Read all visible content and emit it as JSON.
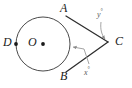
{
  "figure": {
    "type": "circle-with-two-tangents",
    "background_color": "#ffffff",
    "stroke_color": "#3a3a3a",
    "leader_color": "#8a8a8a",
    "label_color": "#1a1a1a",
    "circle": {
      "center_x": 43,
      "center_y": 44,
      "radius": 27
    },
    "points": [
      {
        "id": "A",
        "label": "A",
        "x": 66,
        "y": 16,
        "dot": false
      },
      {
        "id": "B",
        "label": "B",
        "x": 66,
        "y": 72,
        "dot": false
      },
      {
        "id": "C",
        "label": "C",
        "x": 108,
        "y": 42,
        "dot": false
      },
      {
        "id": "D",
        "label": "D",
        "x": 16,
        "y": 44,
        "dot": true
      },
      {
        "id": "O",
        "label": "O",
        "x": 43,
        "y": 44,
        "dot": true
      }
    ],
    "dots": [
      {
        "id": "dot-D",
        "x": 16,
        "y": 44
      },
      {
        "id": "dot-O",
        "x": 43,
        "y": 44
      }
    ],
    "segments": [
      {
        "id": "tangent-AC",
        "from": "A",
        "to": "C",
        "x1": 66,
        "y1": 16,
        "x2": 108,
        "y2": 42
      },
      {
        "id": "tangent-BC",
        "from": "B",
        "to": "C",
        "x1": 66,
        "y1": 72,
        "x2": 108,
        "y2": 42
      }
    ],
    "angle_labels": [
      {
        "id": "angle-y",
        "text": "y",
        "degree_symbol": "°",
        "x": 100,
        "y": 12
      },
      {
        "id": "angle-x",
        "text": "x",
        "degree_symbol": "°",
        "x": 88,
        "y": 70
      }
    ],
    "leaders": [
      {
        "id": "leader-y",
        "from_label": "angle-y",
        "path": "M 101,22 C 100,30 102,36 105,40",
        "arrow_at": {
          "x": 105,
          "y": 40
        }
      },
      {
        "id": "leader-x",
        "from_label": "angle-x",
        "path": "M 89,65 L 84,50 L 73,47",
        "arrow_at": {
          "x": 69,
          "y": 46
        }
      }
    ]
  }
}
